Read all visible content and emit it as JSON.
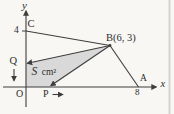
{
  "figure": {
    "type": "coordinate-geometry-diagram",
    "colors": {
      "background": "#f8f7f4",
      "line": "#3e3e3e",
      "shade": "#d9d9d9",
      "text": "#2d2d2d",
      "page_edge": "#d5d3cf"
    },
    "axis": {
      "x_label": "x",
      "y_label": "y",
      "origin_label": "O",
      "x_tick_8": "8",
      "y_tick_4": "4"
    },
    "points": {
      "b_label": "B(6, 3)",
      "c_label": "C",
      "q_label": "Q",
      "p_label": "P",
      "a_label": "A"
    },
    "area": {
      "symbol": "S",
      "unit": "cm²"
    },
    "coordinates": {
      "B": [
        6,
        3
      ],
      "A": [
        8,
        0
      ],
      "C": [
        0,
        4
      ]
    }
  }
}
